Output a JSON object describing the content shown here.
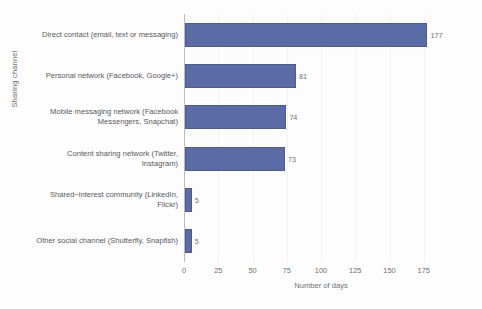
{
  "chart_data": {
    "type": "bar",
    "orientation": "horizontal",
    "title": "",
    "xlabel": "Number of days",
    "ylabel": "Sharing channel",
    "xlim": [
      0,
      200
    ],
    "xticks": [
      0,
      25,
      50,
      75,
      100,
      125,
      150,
      175
    ],
    "grid": true,
    "legend": "none",
    "bar_color": "#5b6ba5",
    "categories": [
      "Direct contact (email, text or messaging)",
      "Personal network (Facebook, Google+)",
      "Mobile messaging network (Facebook Messengers, Snapchat)",
      "Content sharing network (Twitter, Instagram)",
      "Shared−interest community (LinkedIn, Flickr)",
      "Other social channel (Shutterfly, Snapfish)"
    ],
    "values": [
      177,
      81,
      74,
      73,
      5,
      5
    ],
    "value_labels": [
      "177",
      "81",
      "74",
      "73",
      "5",
      "5"
    ]
  },
  "axis": {
    "y_title": "Sharing channel",
    "x_title": "Number of days",
    "x_tick_labels": [
      "0",
      "25",
      "50",
      "75",
      "100",
      "125",
      "150",
      "175"
    ]
  }
}
